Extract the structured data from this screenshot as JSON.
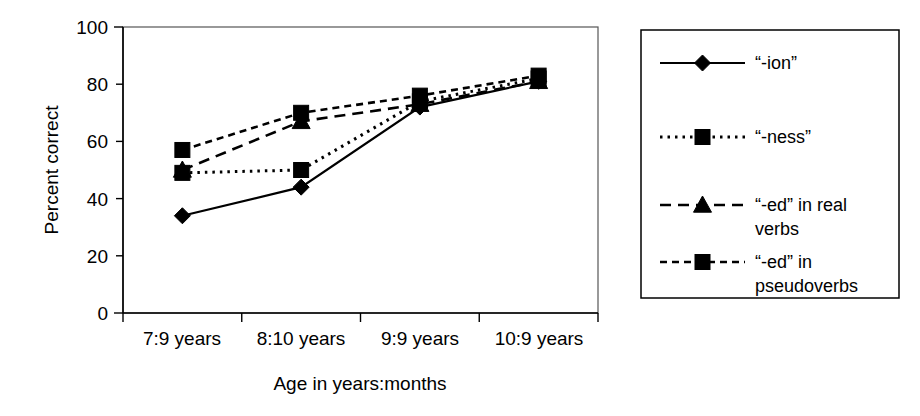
{
  "chart_data": {
    "type": "line",
    "title": "",
    "subtitle": "",
    "xlabel": "Age in years:months",
    "ylabel": "Percent correct",
    "categories": [
      "7:9 years",
      "8:10 years",
      "9:9 years",
      "10:9 years"
    ],
    "ytick_labels": [
      "0",
      "20",
      "40",
      "60",
      "80",
      "100"
    ],
    "ytick_values": [
      0,
      20,
      40,
      60,
      80,
      100
    ],
    "ylim": [
      0,
      100
    ],
    "grid": false,
    "legend_position": "right-outside",
    "series": [
      {
        "name": "“-ion”",
        "marker": "diamond",
        "linestyle": "solid",
        "color": "#000000",
        "values": [
          34,
          44,
          72,
          81
        ]
      },
      {
        "name": "“-ness”",
        "marker": "square",
        "linestyle": "dotted",
        "color": "#000000",
        "values": [
          49,
          50,
          74,
          82
        ]
      },
      {
        "name": "“-ed” in real verbs",
        "marker": "triangle",
        "linestyle": "dashed",
        "color": "#000000",
        "values": [
          50,
          67,
          73,
          81
        ]
      },
      {
        "name": "“-ed” in pseudoverbs",
        "marker": "square",
        "linestyle": "longdash",
        "color": "#000000",
        "values": [
          57,
          70,
          76,
          83
        ]
      }
    ]
  },
  "legend": {
    "entries": [
      {
        "label_line1": "“-ion”",
        "label_line2": ""
      },
      {
        "label_line1": "“-ness”",
        "label_line2": ""
      },
      {
        "label_line1": "“-ed” in real",
        "label_line2": "verbs"
      },
      {
        "label_line1": "“-ed” in",
        "label_line2": "pseudoverbs"
      }
    ]
  }
}
